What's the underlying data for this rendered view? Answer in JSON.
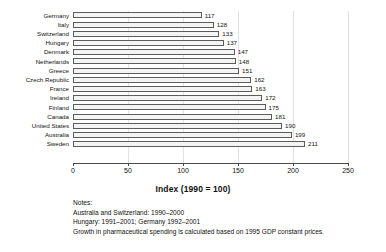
{
  "chart_data": {
    "type": "bar",
    "orientation": "horizontal",
    "title": "",
    "xlabel": "Index (1990 = 100)",
    "ylabel": "",
    "xlim": [
      0,
      250
    ],
    "xticks": [
      0,
      50,
      100,
      150,
      200,
      250
    ],
    "grid": true,
    "legend": null,
    "categories": [
      "Germany",
      "Italy",
      "Switzerland",
      "Hungary",
      "Denmark",
      "Netherlands",
      "Greece",
      "Czech Republic",
      "France",
      "Ireland",
      "Finland",
      "Canada",
      "United States",
      "Australia",
      "Sweden"
    ],
    "values": [
      117,
      128,
      133,
      137,
      147,
      148,
      151,
      162,
      163,
      172,
      175,
      181,
      190,
      199,
      211
    ],
    "data_labels": [
      "117",
      "128",
      "133",
      "137",
      "147",
      "148",
      "151",
      "162",
      "163",
      "172",
      "175",
      "181",
      "190",
      "199",
      "211"
    ],
    "bar_fill": "#f4f4f4",
    "bar_edge": "#5c5c5c"
  },
  "notes": {
    "heading": "Notes:",
    "lines": [
      "Australia and Switzerland: 1990–2000",
      "Hungary: 1991–2001; Germany 1992–2001",
      "Growth in pharmaceutical spending is calculated based on 1995 GDP constant prices."
    ]
  }
}
